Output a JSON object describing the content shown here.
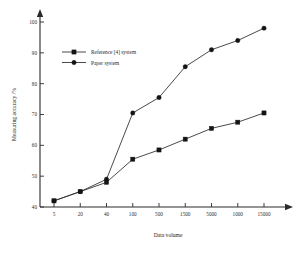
{
  "chart_data": {
    "type": "line",
    "title": "",
    "xlabel": "Data volume",
    "ylabel": "Measuring accuracy /%",
    "categories": [
      "5",
      "20",
      "40",
      "100",
      "500",
      "1500",
      "5000",
      "1000",
      "15000"
    ],
    "ylim": [
      40,
      100
    ],
    "yticks": [
      40,
      50,
      60,
      70,
      80,
      90,
      100
    ],
    "ytick_labels": [
      "40",
      "50",
      "60",
      "70",
      "80",
      "90",
      "100"
    ],
    "grid": false,
    "legend_position": "top-left",
    "series": [
      {
        "name": "Reference [4] system",
        "marker": "square",
        "color": "#141414",
        "values": [
          42,
          45,
          48,
          55.5,
          58.5,
          62,
          65.5,
          67.5,
          70.5
        ]
      },
      {
        "name": "Paper system",
        "marker": "circle",
        "color": "#141414",
        "values": [
          42,
          45,
          49,
          70.5,
          75.5,
          85.5,
          91,
          94,
          98
        ]
      }
    ]
  },
  "legend": {
    "entries": [
      {
        "label": "Reference [4] system",
        "marker": "square"
      },
      {
        "label": "Paper system",
        "marker": "circle"
      }
    ]
  },
  "axes": {
    "x_title": "Data volume",
    "y_title": "Measuring accuracy /%"
  }
}
